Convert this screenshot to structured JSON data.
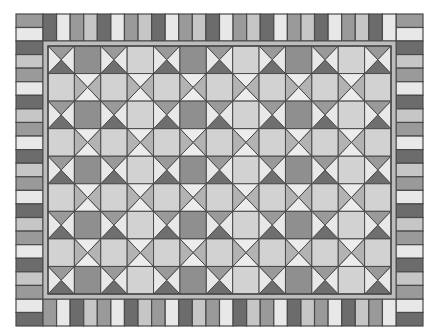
{
  "quilt": {
    "bounds": {
      "x": 16,
      "y": 14,
      "w": 407,
      "h": 312
    },
    "border_width": 27,
    "inner": {
      "x": 43,
      "y": 41,
      "w": 353,
      "h": 258
    },
    "sashing_margin": 5,
    "grid": {
      "cols": 13,
      "rows": 9
    },
    "colors": {
      "outline": "#4a4a4a",
      "sashing": "#bdbdbd",
      "dark_square": "#8f8f8f",
      "light_square": "#d2d2d2",
      "hourglass_top": "#9a9a9a",
      "hourglass_bottom": "#6f6f6f",
      "hourglass_sides": "#e8e8e8",
      "x_top_bottom": "#ececec",
      "x_sides": "#b3b3b3"
    },
    "stripe_palette": {
      "dark": "#6c6c6c",
      "white": "#e8e8e8",
      "medium": "#9a9a9a",
      "light": "#c6c6c6"
    },
    "top_border_sequence": [
      "dark",
      "white",
      "medium",
      "light"
    ],
    "bottom_border_sequence": [
      "medium",
      "white",
      "dark",
      "light"
    ],
    "side_border_sequence": [
      "dark",
      "light",
      "medium",
      "white"
    ],
    "corners": {
      "top_left": [
        "medium",
        "white"
      ],
      "top_right": [
        "medium",
        "white"
      ],
      "bottom_left": [
        "white",
        "dark"
      ],
      "bottom_right": [
        "white",
        "dark"
      ]
    },
    "odd_row_pattern": [
      "hourglass",
      "square_dark",
      "hourglass",
      "square_light"
    ],
    "even_row_pattern": [
      "square_light",
      "x_block"
    ]
  }
}
